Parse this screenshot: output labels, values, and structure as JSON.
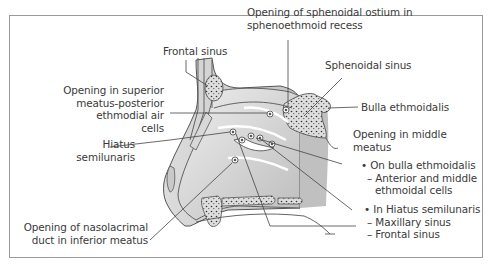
{
  "figure": {
    "type": "anatomical-diagram",
    "colors": {
      "frame": "#9a9a9a",
      "outline": "#555555",
      "fill_light": "#e6e6e6",
      "fill_mid": "#cfcfcf",
      "fill_dark": "#b9b9b9",
      "text": "#3a3a3a"
    }
  },
  "labels": {
    "frontal_sinus": "Frontal sinus",
    "sphenoidal_ostium": [
      "Opening of sphenoidal ostium in",
      "sphenoethmoid recess"
    ],
    "sphenoidal_sinus": "Sphenoidal sinus",
    "superior_meatus": [
      "Opening in superior",
      "meatus-posterior",
      "ethmodial air",
      "cells"
    ],
    "bulla_ethmoidalis": "Bulla ethmoidalis",
    "hiatus_semilunaris": [
      "Hiatus",
      "semilunaris"
    ],
    "middle_meatus": [
      "Opening in middle",
      "meatus"
    ],
    "on_bulla": {
      "heading": "• On bulla ethmoidalis",
      "items": [
        "– Anterior and middle",
        "ethmoidal cells"
      ]
    },
    "in_hiatus": {
      "heading": "• In Hiatus semilunaris",
      "items": [
        "– Maxillary sinus",
        "– Frontal sinus"
      ]
    },
    "nasolacrimal": [
      "Opening of nasolacrimal",
      "duct in inferior meatus"
    ]
  }
}
